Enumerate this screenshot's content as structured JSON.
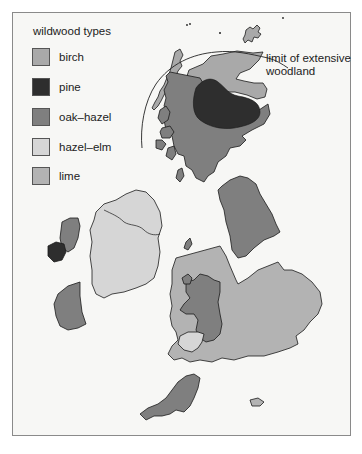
{
  "legend": {
    "title": "wildwood types",
    "items": [
      {
        "key": "birch",
        "label": "birch",
        "color": "#a9a9a9"
      },
      {
        "key": "pine",
        "label": "pine",
        "color": "#2e2e2e"
      },
      {
        "key": "oak_hazel",
        "label": "oak–hazel",
        "color": "#7f7f7f"
      },
      {
        "key": "hazel_elm",
        "label": "hazel–elm",
        "color": "#d6d6d6"
      },
      {
        "key": "lime",
        "label": "lime",
        "color": "#b3b3b3"
      }
    ]
  },
  "annotation": {
    "line1": "limit of extensive",
    "line2": "woodland"
  },
  "regions": [
    {
      "name": "scotland-north-birch",
      "type": "birch"
    },
    {
      "name": "scotland-pine",
      "type": "pine"
    },
    {
      "name": "scotland-oak-hazel",
      "type": "oak_hazel"
    },
    {
      "name": "northern-england-oak-hazel",
      "type": "oak_hazel"
    },
    {
      "name": "wales-oak-hazel",
      "type": "oak_hazel"
    },
    {
      "name": "wales-hazel-elm",
      "type": "hazel_elm"
    },
    {
      "name": "southwest-oak-hazel",
      "type": "oak_hazel"
    },
    {
      "name": "england-lime",
      "type": "lime"
    },
    {
      "name": "ireland-hazel-elm",
      "type": "hazel_elm"
    },
    {
      "name": "ireland-west-oak-hazel",
      "type": "oak_hazel"
    },
    {
      "name": "ireland-west-pine",
      "type": "pine"
    }
  ]
}
